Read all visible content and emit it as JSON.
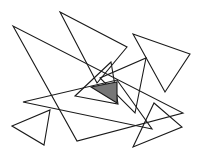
{
  "diagram": {
    "type": "overlapping-triangles",
    "background": "#ffffff",
    "stroke_color": "#1a1a1a",
    "shaded_fill": "#777777",
    "triangles": [
      {
        "id": "t1",
        "points": "13,26 77,141 183,113",
        "shaded": false
      },
      {
        "id": "t2",
        "points": "60,12 127,47 97,83",
        "shaded": false
      },
      {
        "id": "t3",
        "points": "133,34 190,54 165,92",
        "shaded": false
      },
      {
        "id": "t4",
        "points": "23,102 152,129 117,80",
        "shaded": false
      },
      {
        "id": "t5",
        "points": "111,62 75,96 118,104",
        "shaded": false
      },
      {
        "id": "t6",
        "points": "146,58 135,113 100,78",
        "shaded": false
      },
      {
        "id": "t7",
        "points": "12,126 50,110 44,145",
        "shaded": false
      },
      {
        "id": "t8",
        "points": "154,103 182,127 133,147",
        "shaded": false
      },
      {
        "id": "t9",
        "points": "91,87 117,82 117,103",
        "shaded": true
      }
    ]
  }
}
